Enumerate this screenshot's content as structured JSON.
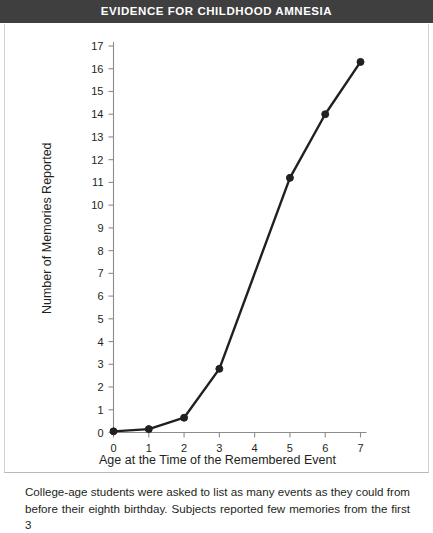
{
  "header": {
    "title": "EVIDENCE FOR CHILDHOOD AMNESIA",
    "background_color": "#3f3f3f",
    "text_color": "#ffffff"
  },
  "caption": {
    "text": "College-age students were asked to list as many events as they could from before their eighth birthday. Subjects reported few memories from the first 3"
  },
  "chart_data": {
    "type": "line",
    "title": "EVIDENCE FOR CHILDHOOD AMNESIA",
    "xlabel": "Age at the Time of the Remembered Event",
    "ylabel": "Number of Memories Reported",
    "xlim": [
      0,
      7
    ],
    "ylim": [
      0,
      17
    ],
    "xticks": [
      0,
      1,
      2,
      3,
      4,
      5,
      6,
      7
    ],
    "xtick_labels": [
      "0",
      "1",
      "2",
      "3",
      "4",
      "5",
      "6",
      "7"
    ],
    "yticks": [
      0,
      1,
      2,
      3,
      4,
      5,
      6,
      7,
      8,
      9,
      10,
      11,
      12,
      13,
      14,
      15,
      16,
      17
    ],
    "ytick_labels": [
      "0",
      "1",
      "2",
      "3",
      "4",
      "5",
      "6",
      "7",
      "8",
      "9",
      "10",
      "11",
      "12",
      "13",
      "14",
      "15",
      "16",
      "17"
    ],
    "grid": false,
    "legend": false,
    "line_color": "#231f20",
    "marker": "circle",
    "series": [
      {
        "name": "Memories reported",
        "x": [
          0,
          1,
          2,
          3,
          5,
          6,
          7
        ],
        "values": [
          0.05,
          0.15,
          0.65,
          2.8,
          11.2,
          14.0,
          16.3
        ]
      }
    ]
  }
}
